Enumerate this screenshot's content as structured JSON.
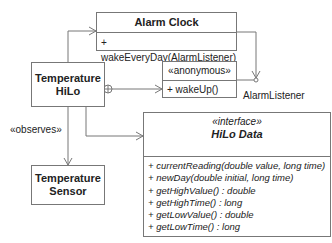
{
  "diagram": {
    "type": "UML class diagram",
    "classes": {
      "alarm_clock": {
        "name": "Alarm Clock",
        "operations": [
          "+ wakeEveryDay(AlarmListener)"
        ]
      },
      "temperature_hilo": {
        "name_line1": "Temperature",
        "name_line2": "HiLo"
      },
      "anonymous": {
        "stereotype": "«anonymous»",
        "operations": [
          "+ wakeUp()"
        ]
      },
      "hilo_data": {
        "stereotype": "«interface»",
        "name": "HiLo Data",
        "operations": [
          "+ currentReading(double value, long time)",
          "+ newDay(double initial, long time)",
          "+ getHighValue() : double",
          "+ getHighTime() : long",
          "+ getLowValue() : double",
          "+ getLowTime() : long"
        ]
      },
      "temperature_sensor": {
        "name_line1": "Temperature",
        "name_line2": "Sensor"
      }
    },
    "labels": {
      "alarm_listener": "AlarmListener",
      "observes": "«observes»"
    },
    "colors": {
      "line": "#777777",
      "text": "#222222",
      "background": "#ffffff"
    }
  }
}
